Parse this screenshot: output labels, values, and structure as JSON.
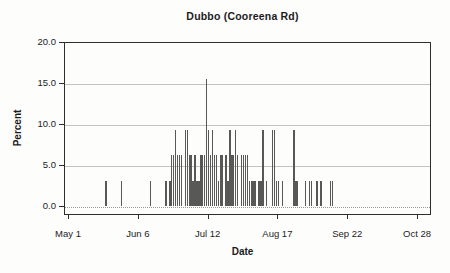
{
  "chart_data": {
    "type": "bar",
    "title": "Dubbo (Cooreena Rd)",
    "xlabel": "Date",
    "ylabel": "Percent",
    "ylim": [
      0,
      20
    ],
    "grid": "horizontal-only",
    "legend": "none",
    "bar_color": "#585856",
    "frame_color": "#2e2e2e",
    "gridline_color": "#c2c2c0",
    "y_ticks": [
      {
        "label": "0.0",
        "value": 0
      },
      {
        "label": "5.0",
        "value": 5
      },
      {
        "label": "10.0",
        "value": 10
      },
      {
        "label": "15.0",
        "value": 15
      },
      {
        "label": "20.0",
        "value": 20
      }
    ],
    "x_ticks": [
      {
        "label": "May 1",
        "day": 0
      },
      {
        "label": "Jun 6",
        "day": 36
      },
      {
        "label": "Jul 12",
        "day": 72
      },
      {
        "label": "Aug 17",
        "day": 108
      },
      {
        "label": "Sep 22",
        "day": 144
      },
      {
        "label": "Oct 28",
        "day": 180
      }
    ],
    "x_unit": "days since May 1",
    "points": [
      {
        "date": "May 20",
        "day": 19,
        "value": 3.1
      },
      {
        "date": "May 28",
        "day": 27,
        "value": 3.1
      },
      {
        "date": "Jun 12",
        "day": 42,
        "value": 3.1
      },
      {
        "date": "Jun 20",
        "day": 50,
        "value": 3.1
      },
      {
        "date": "Jun 22",
        "day": 52,
        "value": 3.1
      },
      {
        "date": "Jun 23",
        "day": 53,
        "value": 6.3
      },
      {
        "date": "Jun 24",
        "day": 54,
        "value": 6.3
      },
      {
        "date": "Jun 25",
        "day": 55,
        "value": 9.4
      },
      {
        "date": "Jun 26",
        "day": 56,
        "value": 6.3
      },
      {
        "date": "Jun 27",
        "day": 57,
        "value": 6.3
      },
      {
        "date": "Jun 28",
        "day": 58,
        "value": 6.3
      },
      {
        "date": "Jun 30",
        "day": 60,
        "value": 9.4
      },
      {
        "date": "Jul 1",
        "day": 61,
        "value": 9.4
      },
      {
        "date": "Jul 2",
        "day": 62,
        "value": 6.3
      },
      {
        "date": "Jul 3",
        "day": 63,
        "value": 6.3
      },
      {
        "date": "Jul 4",
        "day": 64,
        "value": 3.1
      },
      {
        "date": "Jul 5",
        "day": 65,
        "value": 6.3
      },
      {
        "date": "Jul 6",
        "day": 66,
        "value": 3.1
      },
      {
        "date": "Jul 7",
        "day": 67,
        "value": 3.1
      },
      {
        "date": "Jul 8",
        "day": 68,
        "value": 6.3
      },
      {
        "date": "Jul 9",
        "day": 69,
        "value": 6.3
      },
      {
        "date": "Jul 10",
        "day": 70,
        "value": 6.3
      },
      {
        "date": "Jul 11",
        "day": 71,
        "value": 15.6
      },
      {
        "date": "Jul 12",
        "day": 72,
        "value": 9.4
      },
      {
        "date": "Jul 13",
        "day": 73,
        "value": 6.3
      },
      {
        "date": "Jul 14",
        "day": 74,
        "value": 9.4
      },
      {
        "date": "Jul 15",
        "day": 75,
        "value": 6.3
      },
      {
        "date": "Jul 16",
        "day": 76,
        "value": 6.3
      },
      {
        "date": "Jul 17",
        "day": 77,
        "value": 3.1
      },
      {
        "date": "Jul 18",
        "day": 78,
        "value": 6.3
      },
      {
        "date": "Jul 19",
        "day": 79,
        "value": 6.3
      },
      {
        "date": "Jul 21",
        "day": 81,
        "value": 6.3
      },
      {
        "date": "Jul 22",
        "day": 82,
        "value": 3.1
      },
      {
        "date": "Jul 23",
        "day": 83,
        "value": 9.4
      },
      {
        "date": "Jul 24",
        "day": 84,
        "value": 6.3
      },
      {
        "date": "Jul 25",
        "day": 85,
        "value": 6.3
      },
      {
        "date": "Jul 26",
        "day": 86,
        "value": 9.4
      },
      {
        "date": "Jul 27",
        "day": 87,
        "value": 6.3
      },
      {
        "date": "Jul 29",
        "day": 89,
        "value": 6.3
      },
      {
        "date": "Jul 30",
        "day": 90,
        "value": 6.3
      },
      {
        "date": "Jul 31",
        "day": 91,
        "value": 6.3
      },
      {
        "date": "Aug 1",
        "day": 92,
        "value": 6.3
      },
      {
        "date": "Aug 2",
        "day": 93,
        "value": 3.1
      },
      {
        "date": "Aug 3",
        "day": 94,
        "value": 3.1
      },
      {
        "date": "Aug 4",
        "day": 95,
        "value": 3.1
      },
      {
        "date": "Aug 5",
        "day": 96,
        "value": 3.1
      },
      {
        "date": "Aug 7",
        "day": 98,
        "value": 3.1
      },
      {
        "date": "Aug 8",
        "day": 99,
        "value": 3.1
      },
      {
        "date": "Aug 9",
        "day": 100,
        "value": 9.4
      },
      {
        "date": "Aug 11",
        "day": 102,
        "value": 3.1
      },
      {
        "date": "Aug 14",
        "day": 105,
        "value": 9.4
      },
      {
        "date": "Aug 15",
        "day": 106,
        "value": 9.4
      },
      {
        "date": "Aug 16",
        "day": 107,
        "value": 3.1
      },
      {
        "date": "Aug 17",
        "day": 108,
        "value": 3.1
      },
      {
        "date": "Aug 19",
        "day": 110,
        "value": 3.1
      },
      {
        "date": "Aug 25",
        "day": 116,
        "value": 9.4
      },
      {
        "date": "Aug 26",
        "day": 117,
        "value": 3.1
      },
      {
        "date": "Aug 27",
        "day": 118,
        "value": 3.1
      },
      {
        "date": "Aug 31",
        "day": 122,
        "value": 3.1
      },
      {
        "date": "Sep 2",
        "day": 124,
        "value": 3.1
      },
      {
        "date": "Sep 3",
        "day": 125,
        "value": 3.1
      },
      {
        "date": "Sep 6",
        "day": 128,
        "value": 3.1
      },
      {
        "date": "Sep 8",
        "day": 130,
        "value": 3.1
      },
      {
        "date": "Sep 13",
        "day": 135,
        "value": 3.1
      },
      {
        "date": "Sep 14",
        "day": 136,
        "value": 3.1
      }
    ]
  }
}
